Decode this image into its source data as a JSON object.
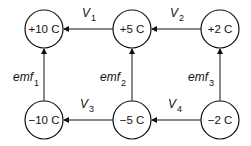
{
  "diagram": {
    "nodes": [
      {
        "id": "n1",
        "label": "+10 C",
        "cx": 44,
        "cy": 29
      },
      {
        "id": "n2",
        "label": "+5 C",
        "cx": 132,
        "cy": 29
      },
      {
        "id": "n3",
        "label": "+2 C",
        "cx": 220,
        "cy": 29
      },
      {
        "id": "n4",
        "label": "−10 C",
        "cx": 44,
        "cy": 120
      },
      {
        "id": "n5",
        "label": "−5 C",
        "cx": 132,
        "cy": 120
      },
      {
        "id": "n6",
        "label": "−2 C",
        "cx": 220,
        "cy": 120
      }
    ],
    "edges": [
      {
        "from": "n2",
        "to": "n1",
        "label": "V",
        "sub": "1"
      },
      {
        "from": "n3",
        "to": "n2",
        "label": "V",
        "sub": "2"
      },
      {
        "from": "n5",
        "to": "n4",
        "label": "V",
        "sub": "3"
      },
      {
        "from": "n6",
        "to": "n5",
        "label": "V",
        "sub": "4"
      },
      {
        "from": "n4",
        "to": "n1",
        "label": "emf",
        "sub": "1"
      },
      {
        "from": "n5",
        "to": "n2",
        "label": "emf",
        "sub": "2"
      },
      {
        "from": "n6",
        "to": "n3",
        "label": "emf",
        "sub": "3"
      }
    ]
  }
}
